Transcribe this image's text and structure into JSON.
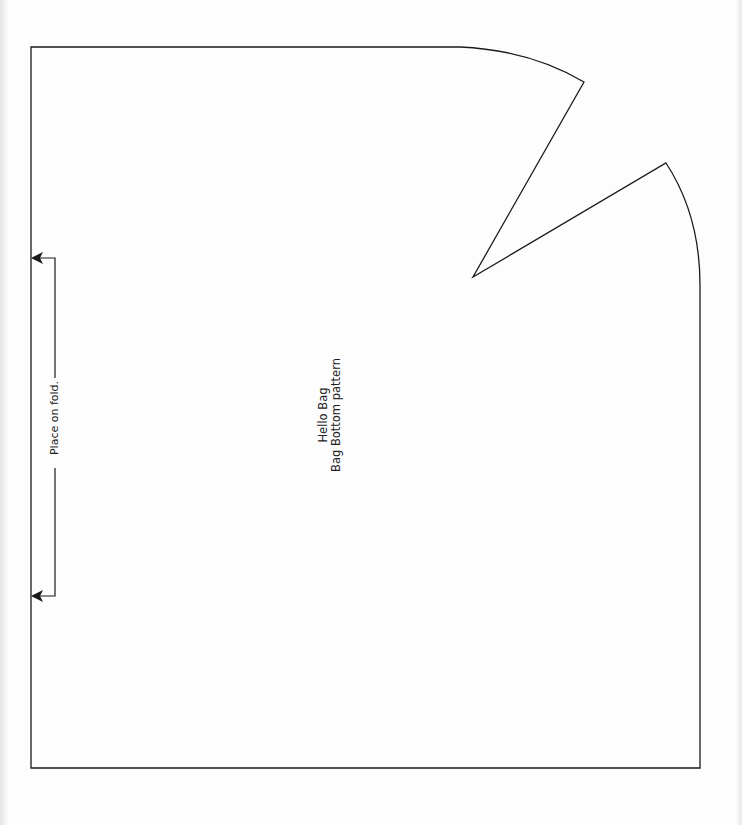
{
  "document": {
    "title": "Hello Bag",
    "subtitle": "Bag Bottom pattern"
  },
  "fold_marker": {
    "label": "Place on fold."
  },
  "colors": {
    "line": "#1a1a1a",
    "paper": "#fdfdfd"
  }
}
